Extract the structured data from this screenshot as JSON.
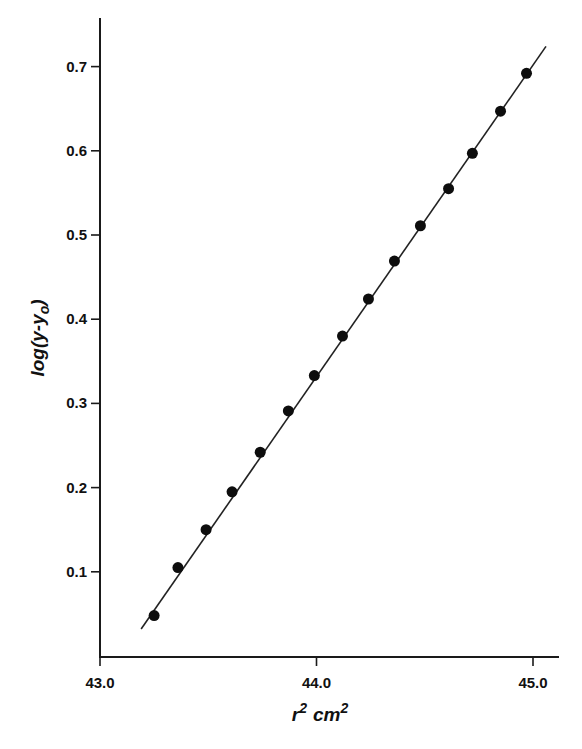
{
  "chart_data": {
    "type": "scatter",
    "title": "",
    "xlabel": "r2 cm2",
    "xlabel_parts": {
      "base": "r",
      "sup1": "2",
      "unit": "cm",
      "sup2": "2"
    },
    "ylabel": "log(y-yo)",
    "ylabel_parts": {
      "prefix": "log(y-y",
      "sub": "o",
      "suffix": ")"
    },
    "xlim": [
      43.0,
      45.1
    ],
    "ylim": [
      0.0,
      0.77
    ],
    "grid": false,
    "legend": null,
    "x_ticks": [
      {
        "value": 43.0,
        "label": "43.0"
      },
      {
        "value": 44.0,
        "label": "44.0"
      },
      {
        "value": 45.0,
        "label": "45.0"
      }
    ],
    "y_ticks": [
      {
        "value": 0.1,
        "label": "0.1"
      },
      {
        "value": 0.2,
        "label": "0.2"
      },
      {
        "value": 0.3,
        "label": "0.3"
      },
      {
        "value": 0.4,
        "label": "0.4"
      },
      {
        "value": 0.5,
        "label": "0.5"
      },
      {
        "value": 0.6,
        "label": "0.6"
      },
      {
        "value": 0.7,
        "label": "0.7"
      }
    ],
    "series": [
      {
        "name": "measured",
        "marker": "filled-circle",
        "color": "#0d0d0d",
        "x": [
          43.25,
          43.36,
          43.49,
          43.61,
          43.74,
          43.87,
          43.99,
          44.12,
          44.24,
          44.36,
          44.48,
          44.61,
          44.72,
          44.85,
          44.97
        ],
        "y": [
          0.048,
          0.105,
          0.15,
          0.195,
          0.242,
          0.291,
          0.333,
          0.38,
          0.424,
          0.469,
          0.511,
          0.555,
          0.597,
          0.647,
          0.692
        ]
      }
    ],
    "fit_line": {
      "name": "linear fit",
      "color": "#222222",
      "x": [
        43.19,
        45.06
      ],
      "y": [
        0.032,
        0.724
      ]
    }
  }
}
